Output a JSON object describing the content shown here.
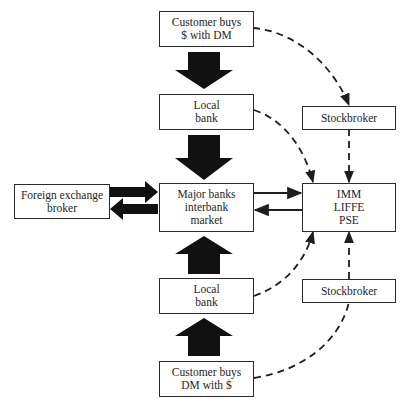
{
  "diagram": {
    "nodes": {
      "customer_buys_dollars": {
        "lines": [
          "Customer buys",
          "$ with DM"
        ]
      },
      "local_bank_top": {
        "lines": [
          "Local",
          "bank"
        ]
      },
      "major_banks": {
        "lines": [
          "Major banks",
          "interbank",
          "market"
        ]
      },
      "local_bank_bottom": {
        "lines": [
          "Local",
          "bank"
        ]
      },
      "customer_buys_dm": {
        "lines": [
          "Customer buys",
          "DM with $"
        ]
      },
      "fx_broker": {
        "lines": [
          "Foreign exchange",
          "broker"
        ]
      },
      "exchanges": {
        "lines": [
          "IMM",
          "LIFFE",
          "PSE"
        ]
      },
      "stockbroker_top": {
        "lines": [
          "Stockbroker"
        ]
      },
      "stockbroker_bottom": {
        "lines": [
          "Stockbroker"
        ]
      }
    },
    "edges": [
      {
        "from": "customer_buys_dollars",
        "to": "local_bank_top",
        "style": "thick-block-arrow"
      },
      {
        "from": "local_bank_top",
        "to": "major_banks",
        "style": "thick-block-arrow"
      },
      {
        "from": "customer_buys_dm",
        "to": "local_bank_bottom",
        "style": "thick-block-arrow"
      },
      {
        "from": "local_bank_bottom",
        "to": "major_banks",
        "style": "thick-block-arrow"
      },
      {
        "from": "fx_broker",
        "to": "major_banks",
        "style": "thick-arrow"
      },
      {
        "from": "major_banks",
        "to": "fx_broker",
        "style": "thick-arrow"
      },
      {
        "from": "major_banks",
        "to": "exchanges",
        "style": "solid-arrow"
      },
      {
        "from": "exchanges",
        "to": "major_banks",
        "style": "solid-arrow"
      },
      {
        "from": "customer_buys_dollars",
        "to": "stockbroker_top",
        "style": "dashed-arrow"
      },
      {
        "from": "stockbroker_top",
        "to": "exchanges",
        "style": "dashed-arrow"
      },
      {
        "from": "local_bank_top",
        "to": "exchanges",
        "style": "dashed-arrow"
      },
      {
        "from": "local_bank_bottom",
        "to": "exchanges",
        "style": "dashed-arrow"
      },
      {
        "from": "stockbroker_bottom",
        "to": "exchanges",
        "style": "dashed-arrow"
      },
      {
        "from": "customer_buys_dm",
        "to": "stockbroker_bottom",
        "style": "dashed-line"
      }
    ],
    "colors": {
      "stroke": "#1e1e1e",
      "background": "#ffffff"
    }
  }
}
